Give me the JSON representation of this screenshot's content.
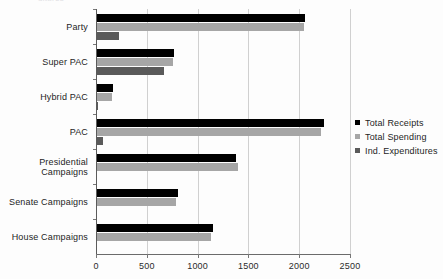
{
  "title_remnant": "ditures",
  "chart_data": {
    "type": "bar",
    "orientation": "horizontal",
    "title": "",
    "xlabel": "",
    "ylabel": "",
    "xlim": [
      0,
      2500
    ],
    "xticks": [
      0,
      500,
      1000,
      1500,
      2000,
      2500
    ],
    "grid": true,
    "legend_position": "right",
    "categories": [
      "Party",
      "Super PAC",
      "Hybrid PAC",
      "PAC",
      "Presidential\nCampaigns",
      "Senate Campaigns",
      "House Campaigns"
    ],
    "series": [
      {
        "name": "Total Receipts",
        "color": "#000000",
        "values": [
          2050,
          760,
          155,
          2230,
          1370,
          800,
          1145
        ]
      },
      {
        "name": "Total Spending",
        "color": "#a6a6a6",
        "values": [
          2040,
          745,
          150,
          2205,
          1385,
          780,
          1125
        ]
      },
      {
        "name": "Ind. Expenditures",
        "color": "#5a5a5a",
        "values": [
          215,
          655,
          10,
          60,
          0,
          0,
          0
        ]
      }
    ]
  },
  "legend": {
    "items": [
      {
        "label": "Total Receipts"
      },
      {
        "label": "Total Spending"
      },
      {
        "label": "Ind. Expenditures"
      }
    ]
  }
}
